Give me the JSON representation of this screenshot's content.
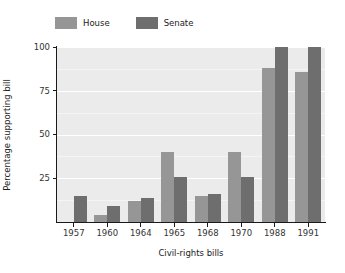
{
  "chart_data": {
    "type": "bar",
    "title": "",
    "subtitle": "",
    "xlabel": "Civil-rights bills",
    "ylabel": "Percentage supporting bill",
    "categories": [
      "1957",
      "1960",
      "1964",
      "1965",
      "1968",
      "1970",
      "1988",
      "1991"
    ],
    "series": [
      {
        "name": "House",
        "color": "#969696",
        "values": [
          null,
          4,
          12,
          40,
          15,
          40,
          88,
          86
        ]
      },
      {
        "name": "Senate",
        "color": "#6e6e6e",
        "values": [
          15,
          9,
          14,
          26,
          16,
          26,
          100,
          100
        ]
      }
    ],
    "ylim": [
      0,
      100
    ],
    "yticks": [
      25,
      50,
      75,
      100
    ],
    "ytick_labels": [
      "25",
      "50",
      "75",
      "100"
    ],
    "grid": true,
    "grid_color": "#ffffff",
    "panel_background": "#ebebeb",
    "legend_position": "top-left",
    "annotations": []
  },
  "legend": {
    "entries": [
      {
        "label": "House",
        "color": "#969696"
      },
      {
        "label": "Senate",
        "color": "#6e6e6e"
      }
    ]
  },
  "axes": {
    "y_title": "Percentage supporting bill",
    "x_title": "Civil-rights bills"
  }
}
